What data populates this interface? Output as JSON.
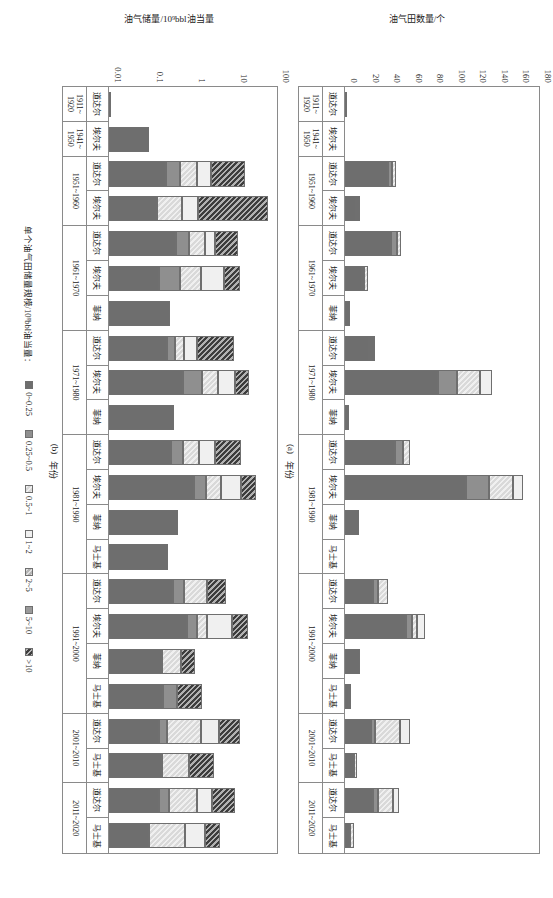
{
  "figure": {
    "orientation": "rotated-90-cw",
    "legend_title": "单个油气田储量规模/10⁹bbl油当量："
  },
  "legend": {
    "items": [
      {
        "label": "0~0.25",
        "color": "#6e6e6e",
        "pattern": "solid"
      },
      {
        "label": "0.25~0.5",
        "color": "#8f8f8f",
        "pattern": "solid"
      },
      {
        "label": "0.5~1",
        "color": "#d9d9d9",
        "pattern": "diag"
      },
      {
        "label": "1~2",
        "color": "#f0f0f0",
        "pattern": "solid"
      },
      {
        "label": "2~5",
        "color": "#b5b5b5",
        "pattern": "diag"
      },
      {
        "label": "5~10",
        "color": "#9a9a9a",
        "pattern": "solid"
      },
      {
        "label": ">10",
        "color": "#3d3d3d",
        "pattern": "diag"
      }
    ]
  },
  "panel_a": {
    "tag": "(a)",
    "xlabel": "年份",
    "ylabel": "油气田数量/个"
  },
  "panel_b": {
    "tag": "(b)",
    "xlabel": "年份",
    "ylabel": "油气储量/10⁹bbl油当量"
  },
  "chart_data": [
    {
      "id": "panel_a",
      "type": "bar",
      "subtype": "stacked",
      "title": "(a)",
      "xlabel": "年份",
      "ylabel": "油气田数量/个",
      "ylim": [
        0,
        180
      ],
      "yticks": [
        0,
        20,
        40,
        60,
        80,
        100,
        120,
        140,
        160,
        180
      ],
      "yscale": "linear",
      "grid": false,
      "legend_position": "bottom-center",
      "legend_title": "单个油气田储量规模/10⁹bbl油当量：",
      "series": [
        {
          "name": "0~0.25",
          "color": "#6e6e6e"
        },
        {
          "name": "0.25~0.5",
          "color": "#8f8f8f"
        },
        {
          "name": "0.5~1",
          "color": "#d9d9d9"
        },
        {
          "name": "1~2",
          "color": "#f0f0f0"
        },
        {
          "name": "2~5",
          "color": "#b5b5b5"
        },
        {
          "name": "5~10",
          "color": "#9a9a9a"
        },
        {
          "name": ">10",
          "color": "#3d3d3d"
        }
      ],
      "groups": [
        {
          "period": "1911~\n1920",
          "companies": [
            "道达尔"
          ]
        },
        {
          "period": "1941~\n1950",
          "companies": [
            "埃尔夫"
          ]
        },
        {
          "period": "1951~1960",
          "companies": [
            "道达尔",
            "埃尔夫"
          ]
        },
        {
          "period": "1961~1970",
          "companies": [
            "道达尔",
            "埃尔夫",
            "菲纳"
          ]
        },
        {
          "period": "1971~1980",
          "companies": [
            "道达尔",
            "埃尔夫",
            "菲纳"
          ]
        },
        {
          "period": "1981~1990",
          "companies": [
            "道达尔",
            "埃尔夫",
            "菲纳",
            "马士基"
          ]
        },
        {
          "period": "1991~2000",
          "companies": [
            "道达尔",
            "埃尔夫",
            "菲纳",
            "马士基"
          ]
        },
        {
          "period": "2001~2010",
          "companies": [
            "道达尔",
            "马士基"
          ]
        },
        {
          "period": "2011~2020",
          "companies": [
            "道达尔",
            "马士基"
          ]
        }
      ],
      "bars": [
        {
          "period": "1911~1920",
          "company": "道达尔",
          "stack": [
            1,
            0,
            0,
            0,
            0,
            0,
            0
          ],
          "total": 1
        },
        {
          "period": "1941~1950",
          "company": "埃尔夫",
          "stack": [
            0,
            0,
            0,
            0,
            0,
            0,
            0
          ],
          "total": 0
        },
        {
          "period": "1951~1960",
          "company": "道达尔",
          "stack": [
            40,
            4,
            3,
            0,
            0,
            0,
            0
          ],
          "total": 47
        },
        {
          "period": "1951~1960",
          "company": "埃尔夫",
          "stack": [
            11,
            1,
            0,
            2,
            0,
            0,
            0
          ],
          "total": 14
        },
        {
          "period": "1961~1970",
          "company": "道达尔",
          "stack": [
            43,
            5,
            4,
            0,
            0,
            0,
            0
          ],
          "total": 52
        },
        {
          "period": "1961~1970",
          "company": "埃尔夫",
          "stack": [
            16,
            2,
            3,
            0,
            0,
            0,
            0
          ],
          "total": 21
        },
        {
          "period": "1961~1970",
          "company": "菲纳",
          "stack": [
            5,
            0,
            0,
            0,
            0,
            0,
            0
          ],
          "total": 5
        },
        {
          "period": "1971~1980",
          "company": "道达尔",
          "stack": [
            23,
            2,
            2,
            1,
            0,
            0,
            0
          ],
          "total": 28
        },
        {
          "period": "1971~1980",
          "company": "埃尔夫",
          "stack": [
            86,
            18,
            21,
            11,
            0,
            0,
            0
          ],
          "total": 136
        },
        {
          "period": "1971~1980",
          "company": "菲纳",
          "stack": [
            4,
            0,
            0,
            0,
            0,
            0,
            0
          ],
          "total": 4
        },
        {
          "period": "1981~1990",
          "company": "道达尔",
          "stack": [
            46,
            8,
            6,
            0,
            0,
            0,
            0
          ],
          "total": 60
        },
        {
          "period": "1981~1990",
          "company": "埃尔夫",
          "stack": [
            112,
            22,
            22,
            9,
            0,
            0,
            0
          ],
          "total": 165
        },
        {
          "period": "1981~1990",
          "company": "菲纳",
          "stack": [
            13,
            0,
            0,
            0,
            0,
            0,
            0
          ],
          "total": 13
        },
        {
          "period": "1981~1990",
          "company": "马士基",
          "stack": [
            0,
            0,
            0,
            0,
            0,
            0,
            0
          ],
          "total": 0
        },
        {
          "period": "1991~2000",
          "company": "道达尔",
          "stack": [
            26,
            5,
            9,
            0,
            0,
            0,
            0
          ],
          "total": 40
        },
        {
          "period": "1991~2000",
          "company": "埃尔夫",
          "stack": [
            57,
            5,
            5,
            7,
            0,
            0,
            0
          ],
          "total": 74
        },
        {
          "period": "1991~2000",
          "company": "菲纳",
          "stack": [
            14,
            0,
            0,
            0,
            0,
            0,
            0
          ],
          "total": 14
        },
        {
          "period": "1991~2000",
          "company": "马士基",
          "stack": [
            5,
            1,
            0,
            0,
            0,
            0,
            0
          ],
          "total": 6
        },
        {
          "period": "2001~2010",
          "company": "道达尔",
          "stack": [
            24,
            4,
            23,
            9,
            0,
            0,
            0
          ],
          "total": 60
        },
        {
          "period": "2001~2010",
          "company": "马士基",
          "stack": [
            8,
            0,
            3,
            0,
            0,
            0,
            0
          ],
          "total": 11
        },
        {
          "period": "2011~2020",
          "company": "道达尔",
          "stack": [
            26,
            5,
            14,
            5,
            0,
            0,
            0
          ],
          "total": 50
        },
        {
          "period": "2011~2020",
          "company": "马士基",
          "stack": [
            5,
            0,
            3,
            0,
            0,
            0,
            0
          ],
          "total": 8
        }
      ]
    },
    {
      "id": "panel_b",
      "type": "bar",
      "subtype": "stacked",
      "title": "(b)",
      "xlabel": "年份",
      "ylabel": "油气储量/10⁹bbl油当量",
      "ylim": [
        0.01,
        100
      ],
      "yticks": [
        0.01,
        0.1,
        1,
        10,
        100
      ],
      "ytick_labels": [
        "0.01",
        "0.1",
        "1",
        "10",
        "100"
      ],
      "yscale": "log",
      "grid": false,
      "legend_position": "bottom-center",
      "legend_title": "单个油气田储量规模/10⁹bbl油当量：",
      "series": [
        {
          "name": "0~0.25",
          "color": "#6e6e6e"
        },
        {
          "name": "0.25~0.5",
          "color": "#8f8f8f"
        },
        {
          "name": "0.5~1",
          "color": "#d9d9d9"
        },
        {
          "name": "1~2",
          "color": "#f0f0f0"
        },
        {
          "name": "2~5",
          "color": "#b5b5b5"
        },
        {
          "name": "5~10",
          "color": "#9a9a9a"
        },
        {
          "name": ">10",
          "color": "#3d3d3d"
        }
      ],
      "groups": [
        {
          "period": "1911~\n1920",
          "companies": [
            "道达尔"
          ]
        },
        {
          "period": "1941~\n1950",
          "companies": [
            "埃尔夫"
          ]
        },
        {
          "period": "1951~1960",
          "companies": [
            "道达尔",
            "埃尔夫"
          ]
        },
        {
          "period": "1961~1970",
          "companies": [
            "道达尔",
            "埃尔夫",
            "菲纳"
          ]
        },
        {
          "period": "1971~1980",
          "companies": [
            "道达尔",
            "埃尔夫",
            "菲纳"
          ]
        },
        {
          "period": "1981~1990",
          "companies": [
            "道达尔",
            "埃尔夫",
            "菲纳",
            "马士基"
          ]
        },
        {
          "period": "1991~2000",
          "companies": [
            "道达尔",
            "埃尔夫",
            "菲纳",
            "马士基"
          ]
        },
        {
          "period": "2001~2010",
          "companies": [
            "道达尔",
            "马士基"
          ]
        },
        {
          "period": "2011~2020",
          "companies": [
            "道达尔",
            "马士基"
          ]
        }
      ],
      "bars": [
        {
          "period": "1911~1920",
          "company": "道达尔",
          "total": 0.0
        },
        {
          "period": "1941~1950",
          "company": "埃尔夫",
          "total": 0.09,
          "stack_fracs": [
            1,
            0,
            0,
            0,
            0,
            0,
            0
          ]
        },
        {
          "period": "1951~1960",
          "company": "道达尔",
          "total": 17.0,
          "stack_fracs": [
            0.42,
            0.1,
            0.13,
            0.1,
            0.0,
            0.0,
            0.25
          ]
        },
        {
          "period": "1951~1960",
          "company": "埃尔夫",
          "total": 60.0,
          "stack_fracs": [
            0.3,
            0.0,
            0.16,
            0.1,
            0.0,
            0.0,
            0.44
          ]
        },
        {
          "period": "1961~1970",
          "company": "道达尔",
          "total": 12.0,
          "stack_fracs": [
            0.52,
            0.1,
            0.12,
            0.08,
            0.0,
            0.0,
            0.18
          ]
        },
        {
          "period": "1961~1970",
          "company": "埃尔夫",
          "total": 13.0,
          "stack_fracs": [
            0.38,
            0.16,
            0.16,
            0.18,
            0.0,
            0.0,
            0.12
          ]
        },
        {
          "period": "1961~1970",
          "company": "菲纳",
          "total": 0.28,
          "stack_fracs": [
            1,
            0,
            0,
            0,
            0,
            0,
            0
          ]
        },
        {
          "period": "1971~1980",
          "company": "道达尔",
          "total": 9.5,
          "stack_fracs": [
            0.46,
            0.07,
            0.07,
            0.1,
            0.0,
            0.0,
            0.3
          ]
        },
        {
          "period": "1971~1980",
          "company": "埃尔夫",
          "total": 22.0,
          "stack_fracs": [
            0.53,
            0.13,
            0.12,
            0.12,
            0.0,
            0.0,
            0.1
          ]
        },
        {
          "period": "1971~1980",
          "company": "菲纳",
          "total": 0.35,
          "stack_fracs": [
            1,
            0,
            0,
            0,
            0,
            0,
            0
          ]
        },
        {
          "period": "1981~1990",
          "company": "道达尔",
          "total": 14.0,
          "stack_fracs": [
            0.47,
            0.09,
            0.12,
            0.12,
            0.0,
            0.0,
            0.2
          ]
        },
        {
          "period": "1981~1990",
          "company": "埃尔夫",
          "total": 32.0,
          "stack_fracs": [
            0.58,
            0.08,
            0.1,
            0.14,
            0.0,
            0.0,
            0.1
          ]
        },
        {
          "period": "1981~1990",
          "company": "菲纳",
          "total": 0.45,
          "stack_fracs": [
            1,
            0,
            0,
            0,
            0,
            0,
            0
          ]
        },
        {
          "period": "1981~1990",
          "company": "马士基",
          "total": 0.26,
          "stack_fracs": [
            1,
            0,
            0,
            0,
            0,
            0,
            0
          ]
        },
        {
          "period": "1991~2000",
          "company": "道达尔",
          "total": 6.0,
          "stack_fracs": [
            0.55,
            0.09,
            0.2,
            0.0,
            0.0,
            0.0,
            0.16
          ]
        },
        {
          "period": "1991~2000",
          "company": "埃尔夫",
          "total": 21.0,
          "stack_fracs": [
            0.56,
            0.07,
            0.07,
            0.18,
            0.0,
            0.0,
            0.12
          ]
        },
        {
          "period": "1991~2000",
          "company": "菲纳",
          "total": 1.1,
          "stack_fracs": [
            0.62,
            0.0,
            0.22,
            0.0,
            0.0,
            0.0,
            0.16
          ]
        },
        {
          "period": "1991~2000",
          "company": "马士基",
          "total": 1.6,
          "stack_fracs": [
            0.58,
            0.16,
            0.0,
            0.0,
            0.0,
            0.0,
            0.26
          ]
        },
        {
          "period": "2001~2010",
          "company": "道达尔",
          "total": 13.0,
          "stack_fracs": [
            0.38,
            0.06,
            0.26,
            0.14,
            0.0,
            0.0,
            0.16
          ]
        },
        {
          "period": "2001~2010",
          "company": "马士基",
          "total": 3.2,
          "stack_fracs": [
            0.5,
            0.0,
            0.26,
            0.0,
            0.0,
            0.0,
            0.24
          ]
        },
        {
          "period": "2011~2020",
          "company": "道达尔",
          "total": 10.0,
          "stack_fracs": [
            0.4,
            0.08,
            0.22,
            0.12,
            0.0,
            0.0,
            0.18
          ]
        },
        {
          "period": "2011~2020",
          "company": "马士基",
          "total": 4.5,
          "stack_fracs": [
            0.36,
            0.0,
            0.32,
            0.18,
            0.0,
            0.0,
            0.14
          ]
        }
      ]
    }
  ]
}
